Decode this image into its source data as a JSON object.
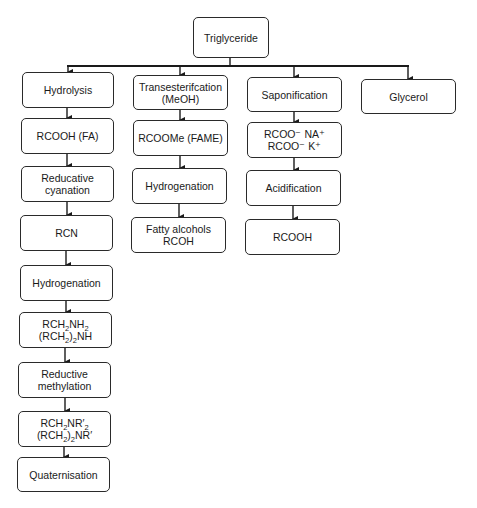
{
  "diagram": {
    "type": "flowchart",
    "root": {
      "id": "triglyceride",
      "label": "Triglyceride"
    },
    "columns": [
      {
        "id": "hydrolysis-branch",
        "steps": [
          {
            "id": "hydrolysis",
            "lines": [
              "Hydrolysis"
            ]
          },
          {
            "id": "rcooh-fa",
            "lines": [
              "RCOOH (FA)"
            ]
          },
          {
            "id": "reducative-cyanation",
            "lines": [
              "Reducative",
              "cyanation"
            ]
          },
          {
            "id": "rcn",
            "lines": [
              "RCN"
            ]
          },
          {
            "id": "hydrogenation-1",
            "lines": [
              "Hydrogenation"
            ]
          },
          {
            "id": "amines",
            "lines": [
              "RCH2NH2",
              "(RCH2)2NH"
            ]
          },
          {
            "id": "reductive-methylation",
            "lines": [
              "Reductive",
              "methylation"
            ]
          },
          {
            "id": "tertiary-amines",
            "lines": [
              "RCH2NR'2",
              "(RCH2)2NR'"
            ]
          },
          {
            "id": "quaternisation",
            "lines": [
              "Quaternisation"
            ]
          }
        ]
      },
      {
        "id": "transesterification-branch",
        "steps": [
          {
            "id": "transesterification",
            "lines": [
              "Transesterifcation",
              "(MeOH)"
            ]
          },
          {
            "id": "rcoome-fame",
            "lines": [
              "RCOOMe (FAME)"
            ]
          },
          {
            "id": "hydrogenation-2",
            "lines": [
              "Hydrogenation"
            ]
          },
          {
            "id": "fatty-alcohols",
            "lines": [
              "Fatty alcohols",
              "RCOH"
            ]
          }
        ]
      },
      {
        "id": "saponification-branch",
        "steps": [
          {
            "id": "saponification",
            "lines": [
              "Saponification"
            ]
          },
          {
            "id": "soaps",
            "lines": [
              "RCOO⁻ NA⁺",
              "RCOO⁻ K⁺"
            ]
          },
          {
            "id": "acidification",
            "lines": [
              "Acidification"
            ]
          },
          {
            "id": "rcooh",
            "lines": [
              "RCOOH"
            ]
          }
        ]
      },
      {
        "id": "glycerol-branch",
        "steps": [
          {
            "id": "glycerol",
            "lines": [
              "Glycerol"
            ]
          }
        ]
      }
    ],
    "labels": {
      "triglyceride": "Triglyceride",
      "hydrolysis": "Hydrolysis",
      "rcooh_fa": "RCOOH (FA)",
      "reducative_1": "Reducative",
      "reducative_2": "cyanation",
      "rcn": "RCN",
      "hydrogenation": "Hydrogenation",
      "amine_1_a": "RCH",
      "amine_1_b": "2",
      "amine_1_c": "NH",
      "amine_1_d": "2",
      "amine_2_a": "(RCH",
      "amine_2_b": "2",
      "amine_2_c": ")",
      "amine_2_d": "2",
      "amine_2_e": "NH",
      "reductive_1": "Reductive",
      "reductive_2": "methylation",
      "tert_1_a": "RCH",
      "tert_1_b": "2",
      "tert_1_c": "NR′",
      "tert_1_d": "2",
      "tert_2_a": "(RCH",
      "tert_2_b": "2",
      "tert_2_c": ")",
      "tert_2_d": "2",
      "tert_2_e": "NR′",
      "quaternisation": "Quaternisation",
      "transest_1": "Transesterifcation",
      "transest_2": "(MeOH)",
      "rcoome": "RCOOMe (FAME)",
      "fatty_1": "Fatty alcohols",
      "fatty_2": "RCOH",
      "saponification": "Saponification",
      "soap_1": "RCOO⁻ NA⁺",
      "soap_2": "RCOO⁻ K⁺",
      "acidification": "Acidification",
      "rcooh": "RCOOH",
      "glycerol": "Glycerol"
    },
    "colors": {
      "stroke": "#2a2a2a",
      "text": "#1a1a1a",
      "background": "#ffffff"
    }
  }
}
